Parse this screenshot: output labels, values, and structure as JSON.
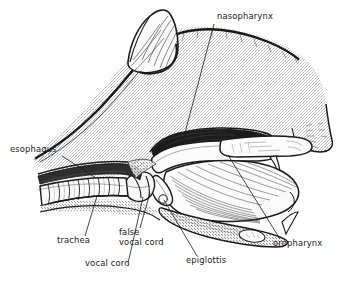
{
  "figure": {
    "background_color": "#ffffff",
    "ink_color": "#1a1a1a",
    "tissue_fill": "#e8e8e8",
    "cavity_fill": "#1c1c1c"
  },
  "labels": [
    {
      "id": "nasopharynx",
      "text": "nasopharynx",
      "text_x": 217,
      "text_y": 19,
      "anchor": "start",
      "leader": [
        [
          214,
          24
        ],
        [
          182,
          144
        ]
      ]
    },
    {
      "id": "esophagus",
      "text": "esophagus",
      "text_x": 10,
      "text_y": 152,
      "anchor": "start",
      "leader": [
        [
          62,
          156
        ],
        [
          96,
          178
        ]
      ]
    },
    {
      "id": "trachea",
      "text": "trachea",
      "text_x": 57,
      "text_y": 243,
      "anchor": "start",
      "leader": [
        [
          85,
          236
        ],
        [
          97,
          196
        ]
      ]
    },
    {
      "id": "false-vocal-cord",
      "text": "false",
      "text_line2": "vocal cord",
      "text_x": 119,
      "text_y": 235,
      "text_y2": 245,
      "anchor": "start",
      "leader": [
        [
          140,
          228
        ],
        [
          150,
          193
        ]
      ]
    },
    {
      "id": "vocal-cord",
      "text": "vocal cord",
      "text_x": 85,
      "text_y": 266,
      "anchor": "start",
      "leader": [
        [
          129,
          259
        ],
        [
          143,
          196
        ]
      ]
    },
    {
      "id": "epiglottis",
      "text": "epiglottis",
      "text_x": 186,
      "text_y": 263,
      "anchor": "start",
      "leader": [
        [
          197,
          256
        ],
        [
          163,
          199
        ]
      ]
    },
    {
      "id": "oropharynx",
      "text": "oropharynx",
      "text_x": 273,
      "text_y": 246,
      "anchor": "start",
      "leader": [
        [
          280,
          239
        ],
        [
          228,
          155
        ]
      ]
    }
  ],
  "structures": [
    {
      "id": "head-outline",
      "name": "cat head, midsagittal"
    },
    {
      "id": "ear",
      "name": "pinna (ear)"
    },
    {
      "id": "nasopharynx-cavity",
      "name": "nasopharynx"
    },
    {
      "id": "soft-palate",
      "name": "soft palate"
    },
    {
      "id": "hard-palate",
      "name": "hard palate"
    },
    {
      "id": "tongue",
      "name": "tongue"
    },
    {
      "id": "epiglottis-flap",
      "name": "epiglottis"
    },
    {
      "id": "larynx",
      "name": "larynx"
    },
    {
      "id": "trachea-rings",
      "name": "tracheal cartilage rings"
    },
    {
      "id": "esophagus-tube",
      "name": "esophagus"
    },
    {
      "id": "mandible",
      "name": "mandible"
    },
    {
      "id": "upper-canine",
      "name": "upper canine tooth"
    },
    {
      "id": "lower-canine",
      "name": "lower canine tooth"
    }
  ]
}
